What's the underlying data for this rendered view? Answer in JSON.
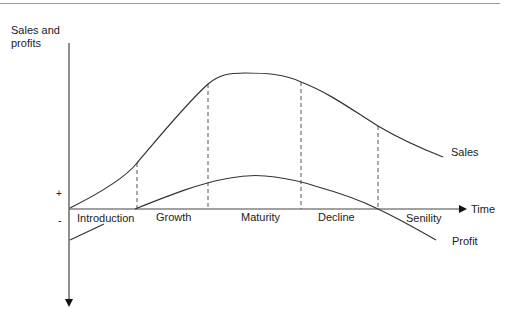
{
  "diagram": {
    "y_axis_label_line1": "Sales and",
    "y_axis_label_line2": "profits",
    "x_axis_label": "Time",
    "plus_sign": "+",
    "minus_sign": "-",
    "curves": {
      "sales": "Sales",
      "profit": "Profit"
    },
    "stages": [
      {
        "label": "Introduction"
      },
      {
        "label": "Growth"
      },
      {
        "label": "Maturity"
      },
      {
        "label": "Decline"
      },
      {
        "label": "Senility"
      }
    ],
    "colors": {
      "line": "#333333",
      "dashed": "#555555",
      "axis": "#333333"
    }
  }
}
